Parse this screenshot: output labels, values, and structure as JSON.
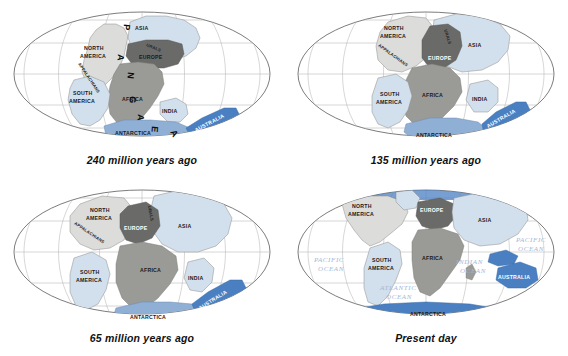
{
  "figure": {
    "panel_count": 4,
    "background_color": "#ffffff"
  },
  "palette": {
    "ocean_fill": "#ffffff",
    "graticule": "#b6b6b6",
    "ellipse_outline": "#5a5a5a",
    "landmass_light": "#d2dfec",
    "landmass_pale": "#dcdcda",
    "landmass_mid_gray": "#9a9a96",
    "landmass_dark_gray": "#6a6a68",
    "australia_blue": "#4a7fc1",
    "antarctica_blue": "#8fafd4",
    "ocean_label": "#9fb9d8",
    "caption_text": "#111111"
  },
  "panels": [
    {
      "id": "panel-240ma",
      "caption": "240 million years ago",
      "supercontinent_letters": [
        "P",
        "A",
        "N",
        "G",
        "A",
        "E",
        "A"
      ],
      "labels": [
        {
          "text": "ASIA",
          "kind": "continent"
        },
        {
          "text": "NORTH AMERICA",
          "kind": "continent"
        },
        {
          "text": "EUROPE",
          "kind": "continent"
        },
        {
          "text": "AFRICA",
          "kind": "continent"
        },
        {
          "text": "SOUTH AMERICA",
          "kind": "continent"
        },
        {
          "text": "INDIA",
          "kind": "continent"
        },
        {
          "text": "ANTARCTICA",
          "kind": "continent"
        },
        {
          "text": "AUSTRALIA",
          "kind": "continent"
        },
        {
          "text": "APPALACHIANS",
          "kind": "mountain-range"
        },
        {
          "text": "URALS",
          "kind": "mountain-range"
        }
      ]
    },
    {
      "id": "panel-135ma",
      "caption": "135 million years ago",
      "supercontinent_letters": [],
      "labels": [
        {
          "text": "NORTH AMERICA",
          "kind": "continent"
        },
        {
          "text": "ASIA",
          "kind": "continent"
        },
        {
          "text": "EUROPE",
          "kind": "continent"
        },
        {
          "text": "AFRICA",
          "kind": "continent"
        },
        {
          "text": "SOUTH AMERICA",
          "kind": "continent"
        },
        {
          "text": "INDIA",
          "kind": "continent"
        },
        {
          "text": "ANTARCTICA",
          "kind": "continent"
        },
        {
          "text": "AUSTRALIA",
          "kind": "continent"
        },
        {
          "text": "APPALACHIANS",
          "kind": "mountain-range"
        },
        {
          "text": "URALS",
          "kind": "mountain-range"
        }
      ]
    },
    {
      "id": "panel-65ma",
      "caption": "65 million years ago",
      "supercontinent_letters": [],
      "labels": [
        {
          "text": "NORTH AMERICA",
          "kind": "continent"
        },
        {
          "text": "ASIA",
          "kind": "continent"
        },
        {
          "text": "EUROPE",
          "kind": "continent"
        },
        {
          "text": "AFRICA",
          "kind": "continent"
        },
        {
          "text": "SOUTH AMERICA",
          "kind": "continent"
        },
        {
          "text": "INDIA",
          "kind": "continent"
        },
        {
          "text": "ANTARCTICA",
          "kind": "continent"
        },
        {
          "text": "AUSTRALIA",
          "kind": "continent"
        },
        {
          "text": "APPALACHIANS",
          "kind": "mountain-range"
        },
        {
          "text": "URALS",
          "kind": "mountain-range"
        }
      ]
    },
    {
      "id": "panel-present",
      "caption": "Present day",
      "supercontinent_letters": [],
      "labels": [
        {
          "text": "NORTH AMERICA",
          "kind": "continent"
        },
        {
          "text": "EUROPE",
          "kind": "continent"
        },
        {
          "text": "ASIA",
          "kind": "continent"
        },
        {
          "text": "AFRICA",
          "kind": "continent"
        },
        {
          "text": "SOUTH AMERICA",
          "kind": "continent"
        },
        {
          "text": "AUSTRALIA",
          "kind": "continent"
        },
        {
          "text": "ANTARCTICA",
          "kind": "continent"
        },
        {
          "text": "PACIFIC OCEAN",
          "kind": "ocean"
        },
        {
          "text": "ATLANTIC OCEAN",
          "kind": "ocean"
        },
        {
          "text": "INDIAN OCEAN",
          "kind": "ocean"
        },
        {
          "text": "PACIFIC OCEAN",
          "kind": "ocean"
        }
      ]
    }
  ],
  "text": {
    "p1": {
      "caption": "240 million years ago",
      "asia": "ASIA",
      "north_america_1": "NORTH",
      "north_america_2": "AMERICA",
      "europe": "EUROPE",
      "africa": "AFRICA",
      "south_america_1": "SOUTH",
      "south_america_2": "AMERICA",
      "india": "INDIA",
      "antarctica": "ANTARCTICA",
      "australia": "AUSTRALIA",
      "appalachians": "APPALACHIANS",
      "urals": "URALS",
      "L1": "P",
      "L2": "A",
      "L3": "N",
      "L4": "G",
      "L5": "A",
      "L6": "E",
      "L7": "A"
    },
    "p2": {
      "caption": "135 million years ago",
      "asia": "ASIA",
      "north_america_1": "NORTH",
      "north_america_2": "AMERICA",
      "europe": "EUROPE",
      "africa": "AFRICA",
      "south_america_1": "SOUTH",
      "south_america_2": "AMERICA",
      "india": "INDIA",
      "antarctica": "ANTARCTICA",
      "australia": "AUSTRALIA",
      "appalachians": "APPALACHIANS",
      "urals": "URALS"
    },
    "p3": {
      "caption": "65 million years ago",
      "asia": "ASIA",
      "north_america_1": "NORTH",
      "north_america_2": "AMERICA",
      "europe": "EUROPE",
      "africa": "AFRICA",
      "south_america_1": "SOUTH",
      "south_america_2": "AMERICA",
      "india": "INDIA",
      "antarctica": "ANTARCTICA",
      "australia": "AUSTRALIA",
      "appalachians": "APPALACHIANS",
      "urals": "URALS"
    },
    "p4": {
      "caption": "Present day",
      "asia": "ASIA",
      "north_america_1": "NORTH",
      "north_america_2": "AMERICA",
      "europe": "EUROPE",
      "africa": "AFRICA",
      "south_america_1": "SOUTH",
      "south_america_2": "AMERICA",
      "australia": "AUSTRALIA",
      "antarctica": "ANTARCTICA",
      "pacific_w_1": "PACIFIC",
      "pacific_w_2": "OCEAN",
      "pacific_e_1": "PACIFIC",
      "pacific_e_2": "OCEAN",
      "atlantic_1": "ATLANTIC",
      "atlantic_2": "OCEAN",
      "indian_1": "INDIAN",
      "indian_2": "OCEAN"
    }
  }
}
